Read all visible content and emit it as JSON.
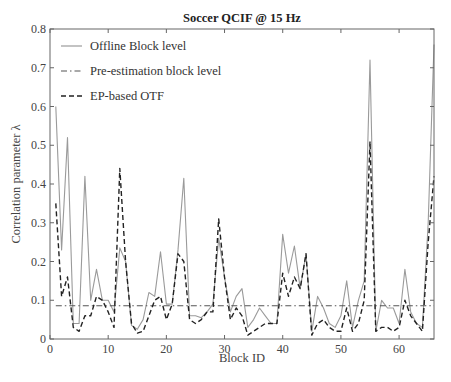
{
  "chart_data": {
    "type": "line",
    "title": "Soccer QCIF @ 15 Hz",
    "xlabel": "Block ID",
    "ylabel": "Correlation parameter λ",
    "xlim": [
      0,
      66
    ],
    "ylim": [
      0,
      0.8
    ],
    "xticks": [
      0,
      10,
      20,
      30,
      40,
      50,
      60
    ],
    "yticks": [
      0,
      0.1,
      0.2,
      0.3,
      0.4,
      0.5,
      0.6,
      0.7,
      0.8
    ],
    "ytick_labels": [
      "0",
      "0.1",
      "0.2",
      "0.3",
      "0.4",
      "0.5",
      "0.6",
      "0.7",
      "0.8"
    ],
    "grid": false,
    "legend_position": "upper left",
    "x": [
      1,
      2,
      3,
      4,
      5,
      6,
      7,
      8,
      9,
      10,
      11,
      12,
      13,
      14,
      15,
      16,
      17,
      18,
      19,
      20,
      21,
      22,
      23,
      24,
      25,
      26,
      27,
      28,
      29,
      30,
      31,
      32,
      33,
      34,
      35,
      36,
      37,
      38,
      39,
      40,
      41,
      42,
      43,
      44,
      45,
      46,
      47,
      48,
      49,
      50,
      51,
      52,
      53,
      54,
      55,
      56,
      57,
      58,
      59,
      60,
      61,
      62,
      63,
      64,
      65,
      66
    ],
    "series": [
      {
        "name": "Offline Block level",
        "style": "solid",
        "color": "#9a9a9a",
        "values": [
          0.6,
          0.23,
          0.52,
          0.04,
          0.04,
          0.42,
          0.1,
          0.18,
          0.1,
          0.1,
          0.07,
          0.235,
          0.2,
          0.035,
          0.025,
          0.05,
          0.12,
          0.11,
          0.225,
          0.09,
          0.09,
          0.23,
          0.415,
          0.06,
          0.06,
          0.055,
          0.07,
          0.09,
          0.26,
          0.16,
          0.07,
          0.11,
          0.13,
          0.03,
          0.05,
          0.08,
          0.06,
          0.04,
          0.04,
          0.27,
          0.17,
          0.24,
          0.13,
          0.22,
          0.02,
          0.11,
          0.08,
          0.04,
          0.03,
          0.06,
          0.15,
          0.03,
          0.1,
          0.15,
          0.72,
          0.02,
          0.1,
          0.08,
          0.08,
          0.04,
          0.18,
          0.07,
          0.04,
          0.03,
          0.3,
          0.76
        ]
      },
      {
        "name": "Pre-estimation block level",
        "style": "dashdot",
        "color": "#555555",
        "values": [
          0.086,
          0.086,
          0.086,
          0.086,
          0.086,
          0.086,
          0.086,
          0.086,
          0.086,
          0.086,
          0.086,
          0.086,
          0.086,
          0.086,
          0.086,
          0.086,
          0.086,
          0.086,
          0.086,
          0.086,
          0.086,
          0.086,
          0.086,
          0.086,
          0.086,
          0.086,
          0.086,
          0.086,
          0.086,
          0.086,
          0.086,
          0.086,
          0.086,
          0.086,
          0.086,
          0.086,
          0.086,
          0.086,
          0.086,
          0.086,
          0.086,
          0.086,
          0.086,
          0.086,
          0.086,
          0.086,
          0.086,
          0.086,
          0.086,
          0.086,
          0.086,
          0.086,
          0.086,
          0.086,
          0.086,
          0.086,
          0.086,
          0.086,
          0.086,
          0.086,
          0.086,
          0.086,
          0.086,
          0.086,
          0.086,
          0.086
        ]
      },
      {
        "name": "EP-based OTF",
        "style": "dashed",
        "color": "#222222",
        "values": [
          0.35,
          0.11,
          0.16,
          0.03,
          0.02,
          0.06,
          0.06,
          0.11,
          0.1,
          0.07,
          0.03,
          0.44,
          0.2,
          0.04,
          0.015,
          0.02,
          0.06,
          0.1,
          0.11,
          0.05,
          0.09,
          0.22,
          0.2,
          0.05,
          0.04,
          0.05,
          0.07,
          0.07,
          0.31,
          0.16,
          0.05,
          0.08,
          0.06,
          0.01,
          0.02,
          0.03,
          0.04,
          0.04,
          0.04,
          0.17,
          0.11,
          0.16,
          0.13,
          0.22,
          0.01,
          0.04,
          0.05,
          0.03,
          0.02,
          0.02,
          0.08,
          0.02,
          0.04,
          0.1,
          0.51,
          0.02,
          0.03,
          0.03,
          0.02,
          0.03,
          0.1,
          0.06,
          0.04,
          0.02,
          0.25,
          0.42
        ]
      }
    ]
  }
}
